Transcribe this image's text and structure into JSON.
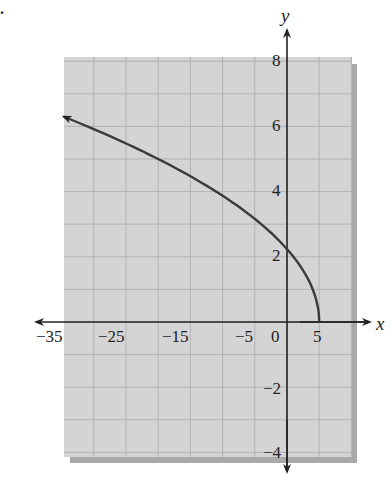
{
  "problem": {
    "marker": "."
  },
  "chart_data": {
    "type": "line",
    "title": "",
    "xlabel": "x",
    "ylabel": "y",
    "equation_hint": "x = 5 - y^2, y >= 0",
    "xlim": [
      -35,
      10
    ],
    "ylim": [
      -4,
      8
    ],
    "grid": true,
    "x_ticks": [
      "-35",
      "-25",
      "-15",
      "-5",
      "0",
      "5"
    ],
    "y_ticks": [
      "8",
      "6",
      "4",
      "2",
      "-2",
      "-4"
    ],
    "series": [
      {
        "name": "curve",
        "x": [
          5,
          4.75,
          4,
          2.75,
          1,
          -1.25,
          -4,
          -7.25,
          -11,
          -15.25,
          -20,
          -25.25,
          -31,
          -34.7
        ],
        "y": [
          0,
          0.5,
          1,
          1.5,
          2,
          2.5,
          3,
          3.5,
          4,
          4.5,
          5,
          5.5,
          6,
          6.3
        ],
        "arrow_end": "left"
      }
    ],
    "colors": {
      "grid_bg": "#d4d4d4",
      "grid_line": "#b2b2b2",
      "shadow": "#a9a9a9",
      "curve": "#3a3a3a",
      "axis": "#222222"
    }
  },
  "labels": {
    "x_axis": "x",
    "y_axis": "y",
    "xt": {
      "m35": "−35",
      "m25": "−25",
      "m15": "−15",
      "m5": "−5",
      "z": "0",
      "p5": "5"
    },
    "yt": {
      "p8": "8",
      "p6": "6",
      "p4": "4",
      "p2": "2",
      "m2": "−2",
      "m4": "−4"
    }
  }
}
